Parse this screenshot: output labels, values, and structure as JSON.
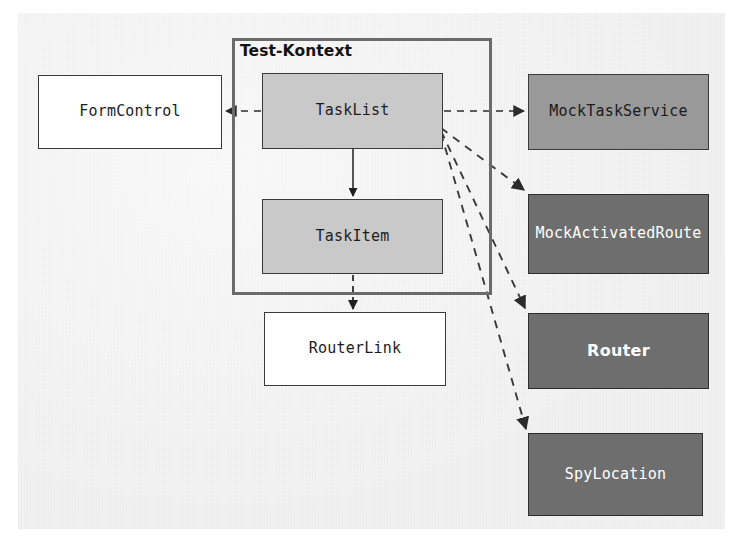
{
  "diagram": {
    "title": "Test-Kontext",
    "type": "component-dependency-diagram",
    "background_color": "#f2f2f2",
    "context": {
      "label": "Test-Kontext",
      "border_color": "#6b6b6b",
      "x": 232,
      "y": 38,
      "w": 260,
      "h": 257,
      "title_x": 240,
      "title_y": 42
    },
    "nodes": [
      {
        "id": "form-control",
        "label": "FormControl",
        "style": "plain",
        "fill": "#ffffff",
        "text_color": "#1d1d1d",
        "x": 38,
        "y": 75,
        "w": 184,
        "h": 74
      },
      {
        "id": "task-list",
        "label": "TaskList",
        "style": "light",
        "fill": "#c9c9c9",
        "text_color": "#1d1d1d",
        "x": 262,
        "y": 73,
        "w": 181,
        "h": 76
      },
      {
        "id": "task-item",
        "label": "TaskItem",
        "style": "light",
        "fill": "#c9c9c9",
        "text_color": "#1d1d1d",
        "x": 262,
        "y": 199,
        "w": 181,
        "h": 75
      },
      {
        "id": "router-link",
        "label": "RouterLink",
        "style": "plain",
        "fill": "#ffffff",
        "text_color": "#1d1d1d",
        "x": 264,
        "y": 312,
        "w": 182,
        "h": 74
      },
      {
        "id": "mock-task-service",
        "label": "MockTaskService",
        "style": "mid",
        "fill": "#999999",
        "text_color": "#1a1a1a",
        "x": 528,
        "y": 74,
        "w": 181,
        "h": 76
      },
      {
        "id": "mock-activated-route",
        "label": "MockActivatedRoute",
        "style": "dark",
        "fill": "#6e6e6e",
        "text_color": "#ffffff",
        "x": 528,
        "y": 194,
        "w": 181,
        "h": 80
      },
      {
        "id": "router",
        "label": "Router",
        "style": "dark sans",
        "fill": "#6e6e6e",
        "text_color": "#ffffff",
        "x": 528,
        "y": 313,
        "w": 181,
        "h": 76
      },
      {
        "id": "spy-location",
        "label": "SpyLocation",
        "style": "dark",
        "fill": "#6e6e6e",
        "text_color": "#ffffff",
        "x": 528,
        "y": 433,
        "w": 175,
        "h": 83
      }
    ],
    "edges": [
      {
        "id": "tasklist-to-formcontrol",
        "from": "task-list",
        "to": "form-control",
        "style": "dashed",
        "arrow": "end"
      },
      {
        "id": "tasklist-to-mocktaskservice",
        "from": "task-list",
        "to": "mock-task-service",
        "style": "dashed",
        "arrow": "end"
      },
      {
        "id": "tasklist-to-taskitem",
        "from": "task-list",
        "to": "task-item",
        "style": "solid",
        "arrow": "end"
      },
      {
        "id": "taskitem-to-routerlink",
        "from": "task-item",
        "to": "router-link",
        "style": "dashed",
        "arrow": "end"
      },
      {
        "id": "tasklist-to-mockactivatedroute",
        "from": "task-list",
        "to": "mock-activated-route",
        "style": "dashed",
        "arrow": "end"
      },
      {
        "id": "tasklist-to-router",
        "from": "task-list",
        "to": "router",
        "style": "dashed",
        "arrow": "end"
      },
      {
        "id": "tasklist-to-spylocation",
        "from": "task-list",
        "to": "spy-location",
        "style": "dashed",
        "arrow": "end"
      }
    ]
  }
}
